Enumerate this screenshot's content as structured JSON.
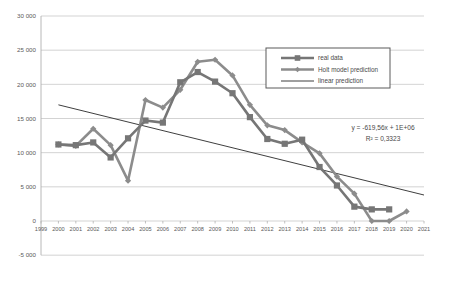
{
  "chart_data": {
    "type": "line",
    "title": "",
    "xlabel": "",
    "ylabel": "",
    "xlim": [
      1999,
      2021
    ],
    "ylim": [
      -5000,
      30000
    ],
    "grid": true,
    "x_ticks": [
      1999,
      2000,
      2001,
      2002,
      2003,
      2004,
      2005,
      2006,
      2007,
      2008,
      2009,
      2010,
      2011,
      2012,
      2013,
      2014,
      2015,
      2016,
      2017,
      2018,
      2019,
      2020,
      2021
    ],
    "y_ticks": [
      -5000,
      0,
      5000,
      10000,
      15000,
      20000,
      25000,
      30000
    ],
    "y_tick_labels": [
      "-5 000",
      "0",
      "5 000",
      "10 000",
      "15 000",
      "20 000",
      "25 000",
      "30 000"
    ],
    "legend_position": "top-right",
    "series": [
      {
        "name": "real data",
        "color": "#767676",
        "marker": "square",
        "x": [
          2000,
          2001,
          2002,
          2003,
          2004,
          2005,
          2006,
          2007,
          2008,
          2009,
          2010,
          2011,
          2012,
          2013,
          2014,
          2015,
          2016,
          2017,
          2018,
          2019
        ],
        "values": [
          11200,
          11100,
          11500,
          9300,
          12100,
          14700,
          14400,
          20300,
          21800,
          20400,
          18700,
          15200,
          12000,
          11300,
          11900,
          7900,
          5200,
          2100,
          1700,
          1700
        ]
      },
      {
        "name": "Holt model prediction",
        "color": "#8c8c8c",
        "marker": "diamond",
        "x": [
          2000,
          2001,
          2002,
          2003,
          2004,
          2005,
          2006,
          2007,
          2008,
          2009,
          2010,
          2011,
          2012,
          2013,
          2014,
          2015,
          2016,
          2017,
          2018,
          2019,
          2020
        ],
        "values": [
          11200,
          11000,
          13500,
          11100,
          5900,
          17700,
          16600,
          19200,
          23300,
          23600,
          21300,
          17000,
          14000,
          13300,
          11500,
          9900,
          6500,
          4000,
          0,
          0,
          1400
        ]
      },
      {
        "name": "linear prediction",
        "color": "#3f3f3f",
        "marker": "none",
        "x": [
          2000,
          2021
        ],
        "values": [
          17000,
          3800
        ]
      }
    ],
    "annotations": {
      "equation": "y = -619,56x + 1E+06",
      "r_squared": "R² = 0,3323"
    },
    "legend_entries": [
      {
        "label": "real data",
        "color": "#767676",
        "marker": "square"
      },
      {
        "label": "Holt model prediction",
        "color": "#8c8c8c",
        "marker": "diamond"
      },
      {
        "label": "linear prediction",
        "color": "#3f3f3f",
        "marker": "none"
      }
    ],
    "colors": {
      "real_data": "#767676",
      "holt_prediction": "#8c8c8c",
      "linear_prediction": "#3f3f3f",
      "gridline": "#c8c8c8",
      "axis": "#b0b0b0",
      "legend_border": "#5a5a5a",
      "text": "#5a5a5a",
      "background": "#ffffff"
    }
  }
}
